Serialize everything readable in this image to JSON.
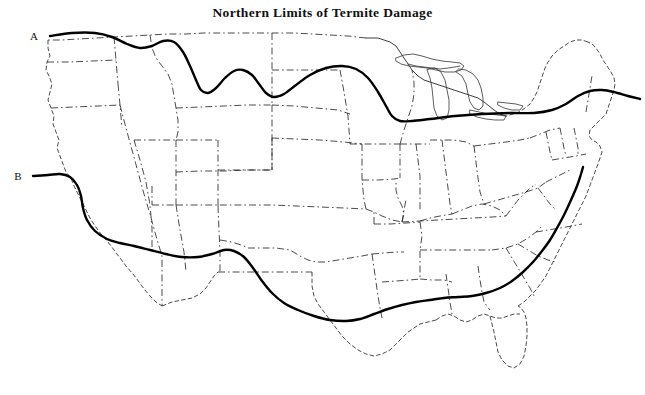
{
  "figure": {
    "title": "Northern Limits of Termite Damage",
    "width": 645,
    "height": 395,
    "background_color": "#ffffff",
    "line_color": "#000000",
    "border_color": "#2b2b2b"
  },
  "labels": {
    "line_a": "A",
    "line_b": "B"
  },
  "chart_data": {
    "type": "map",
    "title": "Northern Limits of Termite Damage",
    "region": "Contiguous United States",
    "legend_position": "inline-left-endpoints",
    "grid": false,
    "annotations": [
      {
        "id": "A",
        "label": "A",
        "label_x": 38,
        "label_y": 36,
        "description": "Northern limit line A - subterranean termite damage limit, running near the Canadian border in the west, dipping through Idaho and Wyoming, crossing the northern plains and the Great Lakes, then rising into New England."
      },
      {
        "id": "B",
        "label": "B",
        "label_x": 22,
        "label_y": 176,
        "description": "Northern limit line B - drywood termite damage limit, running from northern California south through Nevada and Arizona, across Texas and the Gulf states, then northeast along the Atlantic coast to the mid-Atlantic."
      }
    ],
    "series": [
      {
        "name": "A",
        "points": [
          [
            50,
            36
          ],
          [
            72,
            33
          ],
          [
            95,
            33
          ],
          [
            112,
            37
          ],
          [
            127,
            44
          ],
          [
            140,
            48
          ],
          [
            152,
            46
          ],
          [
            163,
            41
          ],
          [
            174,
            42
          ],
          [
            183,
            52
          ],
          [
            190,
            66
          ],
          [
            196,
            80
          ],
          [
            201,
            90
          ],
          [
            208,
            93
          ],
          [
            216,
            88
          ],
          [
            225,
            78
          ],
          [
            234,
            71
          ],
          [
            243,
            70
          ],
          [
            252,
            75
          ],
          [
            259,
            84
          ],
          [
            266,
            93
          ],
          [
            274,
            97
          ],
          [
            284,
            94
          ],
          [
            296,
            85
          ],
          [
            310,
            75
          ],
          [
            326,
            68
          ],
          [
            342,
            66
          ],
          [
            356,
            69
          ],
          [
            368,
            78
          ],
          [
            378,
            92
          ],
          [
            386,
            106
          ],
          [
            392,
            116
          ],
          [
            400,
            121
          ],
          [
            412,
            121
          ],
          [
            430,
            119
          ],
          [
            455,
            116
          ],
          [
            482,
            114
          ],
          [
            510,
            113
          ],
          [
            534,
            113
          ],
          [
            552,
            110
          ],
          [
            566,
            104
          ],
          [
            578,
            96
          ],
          [
            590,
            91
          ],
          [
            602,
            90
          ],
          [
            614,
            92
          ],
          [
            628,
            96
          ],
          [
            640,
            99
          ]
        ]
      },
      {
        "name": "B",
        "points": [
          [
            33,
            176
          ],
          [
            48,
            175
          ],
          [
            60,
            174
          ],
          [
            70,
            177
          ],
          [
            77,
            185
          ],
          [
            81,
            196
          ],
          [
            83,
            208
          ],
          [
            87,
            220
          ],
          [
            95,
            231
          ],
          [
            107,
            239
          ],
          [
            120,
            243
          ],
          [
            134,
            246
          ],
          [
            150,
            250
          ],
          [
            166,
            254
          ],
          [
            182,
            257
          ],
          [
            198,
            257
          ],
          [
            212,
            254
          ],
          [
            224,
            250
          ],
          [
            234,
            251
          ],
          [
            244,
            257
          ],
          [
            253,
            268
          ],
          [
            262,
            281
          ],
          [
            272,
            293
          ],
          [
            284,
            303
          ],
          [
            298,
            310
          ],
          [
            314,
            316
          ],
          [
            330,
            320
          ],
          [
            346,
            321
          ],
          [
            360,
            319
          ],
          [
            374,
            314
          ],
          [
            388,
            309
          ],
          [
            402,
            305
          ],
          [
            416,
            302
          ],
          [
            430,
            300
          ],
          [
            444,
            298
          ],
          [
            458,
            297
          ],
          [
            472,
            296
          ],
          [
            486,
            293
          ],
          [
            500,
            288
          ],
          [
            512,
            281
          ],
          [
            523,
            272
          ],
          [
            533,
            262
          ],
          [
            542,
            251
          ],
          [
            550,
            240
          ],
          [
            557,
            228
          ],
          [
            564,
            215
          ],
          [
            571,
            200
          ],
          [
            577,
            186
          ],
          [
            581,
            174
          ],
          [
            583,
            167
          ]
        ]
      }
    ]
  }
}
